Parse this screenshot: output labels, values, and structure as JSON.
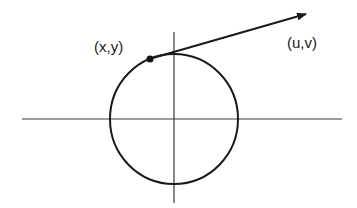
{
  "diagram": {
    "type": "circle-with-tangent-vector",
    "labels": {
      "point": "(x,y)",
      "vector": "(u,v)"
    },
    "colors": {
      "stroke": "#1a1a1a",
      "axis": "#3a3a3a",
      "background": "#ffffff"
    },
    "elements": {
      "circle": {
        "center": [
          174,
          119
        ],
        "radius": 64
      },
      "x_axis": {
        "from": [
          22,
          119
        ],
        "to": [
          342,
          119
        ]
      },
      "y_axis": {
        "from": [
          174,
          32
        ],
        "to": [
          174,
          203
        ]
      },
      "point": {
        "at": [
          150,
          59
        ]
      },
      "vector": {
        "from": [
          150,
          59
        ],
        "to": [
          306,
          14
        ]
      }
    }
  }
}
